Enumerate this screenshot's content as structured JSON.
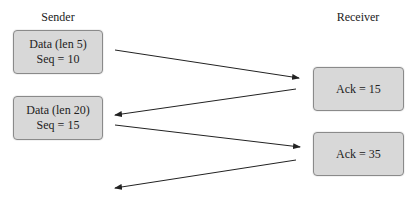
{
  "lanes": {
    "sender": "Sender",
    "receiver": "Receiver"
  },
  "sender_boxes": [
    {
      "line1": "Data (len 5)",
      "line2": "Seq = 10"
    },
    {
      "line1": "Data (len 20)",
      "line2": "Seq = 15"
    }
  ],
  "receiver_boxes": [
    {
      "line1": "Ack = 15"
    },
    {
      "line1": "Ack = 35"
    }
  ],
  "arrows": [
    {
      "from": "sender",
      "to": "receiver",
      "label": ""
    },
    {
      "from": "receiver",
      "to": "sender",
      "label": ""
    },
    {
      "from": "sender",
      "to": "receiver",
      "label": ""
    },
    {
      "from": "receiver",
      "to": "sender",
      "label": ""
    }
  ]
}
